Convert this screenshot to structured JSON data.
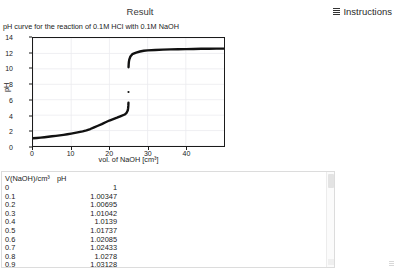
{
  "header": {
    "result_label": "Result",
    "instructions_label": "Instructions",
    "menu_icon": "hamburger-icon"
  },
  "chart_data": {
    "type": "line",
    "title": "pH curve for the reaction of 0.1M HCl with 0.1M NaOH",
    "xlabel": "vol. of NaOH [cm³]",
    "ylabel": "pH",
    "xlim": [
      0,
      50
    ],
    "ylim": [
      0,
      14
    ],
    "xticks": [
      0,
      10,
      20,
      30,
      40
    ],
    "yticks": [
      0,
      2,
      4,
      6,
      8,
      10,
      12,
      14
    ],
    "grid": true,
    "legend": "none",
    "series": [
      {
        "name": "pH titration curve",
        "x": [
          0,
          1,
          2,
          3,
          4,
          5,
          6,
          7,
          8,
          9,
          10,
          11,
          12,
          13,
          14,
          15,
          16,
          17,
          18,
          19,
          20,
          21,
          22,
          23,
          24,
          24.5,
          24.8,
          24.9,
          24.95,
          24.99
        ],
        "y": [
          1.0,
          1.04,
          1.09,
          1.14,
          1.2,
          1.26,
          1.32,
          1.38,
          1.45,
          1.52,
          1.6,
          1.69,
          1.79,
          1.9,
          2.03,
          2.2,
          2.41,
          2.62,
          2.83,
          3.08,
          3.3,
          3.48,
          3.67,
          3.88,
          4.08,
          4.3,
          4.6,
          4.9,
          5.2,
          5.6
        ]
      },
      {
        "name": "equivalence point",
        "x": [
          25
        ],
        "y": [
          7.0
        ]
      },
      {
        "name": "post-equivalence branch",
        "x": [
          25.01,
          25.05,
          25.1,
          25.2,
          25.5,
          26,
          27,
          28,
          29,
          30,
          32,
          34,
          36,
          38,
          40,
          42,
          44,
          46,
          48,
          50
        ],
        "y": [
          10.2,
          10.6,
          10.9,
          11.2,
          11.6,
          11.9,
          12.1,
          12.25,
          12.35,
          12.4,
          12.45,
          12.5,
          12.52,
          12.54,
          12.56,
          12.58,
          12.6,
          12.61,
          12.62,
          12.63
        ]
      }
    ]
  },
  "table": {
    "columns": [
      "V(NaOH)/cm³",
      "pH"
    ],
    "rows": [
      [
        "0",
        "1"
      ],
      [
        "0.1",
        "1.00347"
      ],
      [
        "0.2",
        "1.00695"
      ],
      [
        "0.3",
        "1.01042"
      ],
      [
        "0.4",
        "1.0139"
      ],
      [
        "0.5",
        "1.01737"
      ],
      [
        "0.6",
        "1.02085"
      ],
      [
        "0.7",
        "1.02433"
      ],
      [
        "0.8",
        "1.0278"
      ],
      [
        "0.9",
        "1.03128"
      ]
    ]
  }
}
